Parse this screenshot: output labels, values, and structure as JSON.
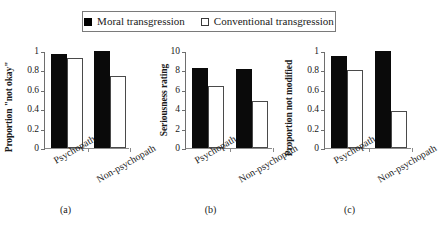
{
  "legend": {
    "entries": [
      {
        "label": "Moral transgression",
        "marker": "filled-square-icon"
      },
      {
        "label": "Conventional transgression",
        "marker": "open-square-icon"
      }
    ]
  },
  "chart_data": [
    {
      "type": "bar",
      "panel": "(a)",
      "title": "",
      "xlabel": "",
      "ylabel": "Proportion \"not okay\"",
      "categories": [
        "Psychopath",
        "Non-psychopath"
      ],
      "ylim": [
        0,
        1
      ],
      "yticks": [
        "0",
        "0.2",
        "0.4",
        "0.6",
        "0.8",
        "1"
      ],
      "ytick_values": [
        0,
        0.2,
        0.4,
        0.6,
        0.8,
        1
      ],
      "grid": false,
      "legend_position": "top-center",
      "series": [
        {
          "name": "Moral transgression",
          "values": [
            0.97,
            1.0
          ]
        },
        {
          "name": "Conventional transgression",
          "values": [
            0.93,
            0.74
          ]
        }
      ]
    },
    {
      "type": "bar",
      "panel": "(b)",
      "title": "",
      "xlabel": "",
      "ylabel": "Seriousness rating",
      "categories": [
        "Psychopath",
        "Non-psychopath"
      ],
      "ylim": [
        0,
        10
      ],
      "yticks": [
        "0",
        "2",
        "4",
        "6",
        "8",
        "10"
      ],
      "ytick_values": [
        0,
        2,
        4,
        6,
        8,
        10
      ],
      "grid": false,
      "legend_position": "top-center",
      "series": [
        {
          "name": "Moral transgression",
          "values": [
            8.3,
            8.1
          ]
        },
        {
          "name": "Conventional transgression",
          "values": [
            6.4,
            4.8
          ]
        }
      ]
    },
    {
      "type": "bar",
      "panel": "(c)",
      "title": "",
      "xlabel": "",
      "ylabel": "Proportion not modified",
      "categories": [
        "Psychopath",
        "Non-psychopath"
      ],
      "ylim": [
        0,
        1
      ],
      "yticks": [
        "0",
        "0.2",
        "0.4",
        "0.6",
        "0.8",
        "1"
      ],
      "ytick_values": [
        0,
        0.2,
        0.4,
        0.6,
        0.8,
        1
      ],
      "grid": false,
      "legend_position": "top-center",
      "series": [
        {
          "name": "Moral transgression",
          "values": [
            0.95,
            1.0
          ]
        },
        {
          "name": "Conventional transgression",
          "values": [
            0.8,
            0.38
          ]
        }
      ]
    }
  ],
  "colors": {
    "moral_bar": "#0a0a0a",
    "conventional_bar": "#ffffff",
    "conventional_bar_border": "#4a4a4a",
    "axis": "#6e6e6e",
    "background": "#ffffff"
  }
}
